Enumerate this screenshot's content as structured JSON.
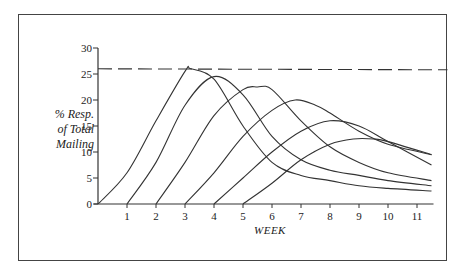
{
  "chart_data": {
    "type": "line",
    "title": "",
    "xlabel": "WEEK",
    "ylabel": "% Resp. of Total Mailing",
    "ylabel_lines": [
      "% Resp.",
      "of Total",
      "Mailing"
    ],
    "xlim": [
      0,
      11.5
    ],
    "ylim": [
      0,
      30
    ],
    "x_ticks": [
      1,
      2,
      3,
      4,
      5,
      6,
      7,
      8,
      9,
      10,
      11
    ],
    "y_ticks": [
      0,
      5,
      10,
      15,
      20,
      25,
      30
    ],
    "grid": false,
    "legend": null,
    "reference_line": {
      "style": "dashed",
      "y": 26,
      "label": ""
    },
    "series": [
      {
        "name": "Mailing 1",
        "start_week": 0,
        "peak_week": 3.2,
        "peak_value": 26,
        "end_value": 2.5,
        "points": [
          [
            0,
            0
          ],
          [
            1,
            6
          ],
          [
            2,
            16
          ],
          [
            3,
            25.5
          ],
          [
            3.2,
            26
          ],
          [
            4,
            24
          ],
          [
            5,
            15
          ],
          [
            6,
            8
          ],
          [
            7,
            5.5
          ],
          [
            8,
            4.5
          ],
          [
            9,
            3.5
          ],
          [
            10,
            3
          ],
          [
            11.5,
            2.5
          ]
        ]
      },
      {
        "name": "Mailing 2",
        "start_week": 1,
        "peak_week": 4.0,
        "peak_value": 24.5,
        "end_value": 3.5,
        "points": [
          [
            1,
            0
          ],
          [
            2,
            8
          ],
          [
            3,
            19
          ],
          [
            4,
            24.5
          ],
          [
            5,
            21
          ],
          [
            6,
            13
          ],
          [
            7,
            8.5
          ],
          [
            8,
            6.5
          ],
          [
            9,
            5.5
          ],
          [
            10,
            4.5
          ],
          [
            11.5,
            3.5
          ]
        ]
      },
      {
        "name": "Mailing 3",
        "start_week": 2,
        "peak_week": 5.5,
        "peak_value": 22.5,
        "end_value": 4.5,
        "points": [
          [
            2,
            0
          ],
          [
            3,
            8
          ],
          [
            4,
            17
          ],
          [
            5,
            22
          ],
          [
            5.5,
            22.5
          ],
          [
            6,
            22
          ],
          [
            7,
            16
          ],
          [
            8,
            11
          ],
          [
            9,
            8
          ],
          [
            10,
            6
          ],
          [
            11.5,
            4.5
          ]
        ]
      },
      {
        "name": "Mailing 4",
        "start_week": 3,
        "peak_week": 6.8,
        "peak_value": 20,
        "end_value": 9.5,
        "points": [
          [
            3,
            0
          ],
          [
            4,
            6
          ],
          [
            5,
            13
          ],
          [
            6,
            18
          ],
          [
            6.8,
            20
          ],
          [
            7.5,
            19
          ],
          [
            8,
            17.5
          ],
          [
            9,
            14
          ],
          [
            10,
            11.5
          ],
          [
            11.5,
            9.5
          ]
        ]
      },
      {
        "name": "Mailing 5",
        "start_week": 4,
        "peak_week": 8.0,
        "peak_value": 16,
        "end_value": 7.5,
        "points": [
          [
            4,
            0
          ],
          [
            5,
            5
          ],
          [
            6,
            10
          ],
          [
            7,
            14
          ],
          [
            8,
            16
          ],
          [
            9,
            15
          ],
          [
            10,
            12
          ],
          [
            11.5,
            7.5
          ]
        ]
      },
      {
        "name": "Mailing 6",
        "start_week": 5,
        "peak_week": 8.8,
        "peak_value": 12.5,
        "end_value": 9.5,
        "points": [
          [
            5,
            0
          ],
          [
            6,
            4
          ],
          [
            7,
            8.5
          ],
          [
            8,
            11.5
          ],
          [
            8.8,
            12.5
          ],
          [
            9.5,
            12.5
          ],
          [
            10,
            12
          ],
          [
            11.5,
            9.5
          ]
        ]
      }
    ]
  }
}
